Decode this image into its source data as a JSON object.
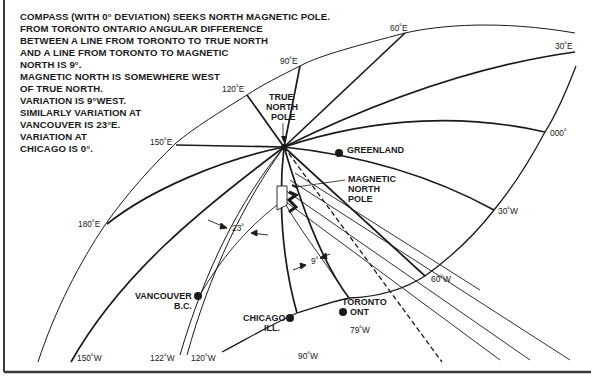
{
  "notes": [
    "COMPASS (WITH 0° DEVIATION) SEEKS NORTH MAGNETIC POLE.",
    "FROM TORONTO ONTARIO  ANGULAR DIFFERENCE",
    "BETWEEN A LINE  FROM TORONTO TO TRUE NORTH",
    "AND A LINE FROM TORONTO TO MAGNETIC",
    "NORTH IS 9°.",
    "MAGNETIC NORTH IS  SOMEWHERE WEST",
    "OF TRUE NORTH.",
    "VARIATION IS 9°WEST.",
    "SIMILARLY VARIATION AT",
    "VANCOUVER IS 23°E.",
    "VARIATION AT",
    "CHICAGO IS 0°."
  ],
  "meridians": {
    "e60": "60˚E",
    "e30": "30˚E",
    "e90": "90˚E",
    "e120": "120˚E",
    "e150": "150˚E",
    "e180": "180˚E",
    "zero": "000˚",
    "w30": "30˚W",
    "w60": "60˚W",
    "w79": "79˚W",
    "w90": "90˚W",
    "w120": "120˚W",
    "w122": "122˚W",
    "w150": "150˚W"
  },
  "places": {
    "true_north": [
      "TRUE",
      "NORTH",
      "POLE"
    ],
    "magnetic_north": [
      "MAGNETIC",
      "NORTH",
      "POLE"
    ],
    "greenland": "GREENLAND",
    "vancouver": [
      "VANCOUVER",
      "B.C."
    ],
    "chicago": [
      "CHICAGO",
      "ILL."
    ],
    "toronto": [
      "TORONTO",
      "ONT"
    ]
  },
  "angles": {
    "vancouver": "23˚",
    "toronto": "9˚"
  },
  "colors": {
    "ink": "#1a1a1a",
    "paper": "#ffffff",
    "frame": "#3a3a3a"
  }
}
